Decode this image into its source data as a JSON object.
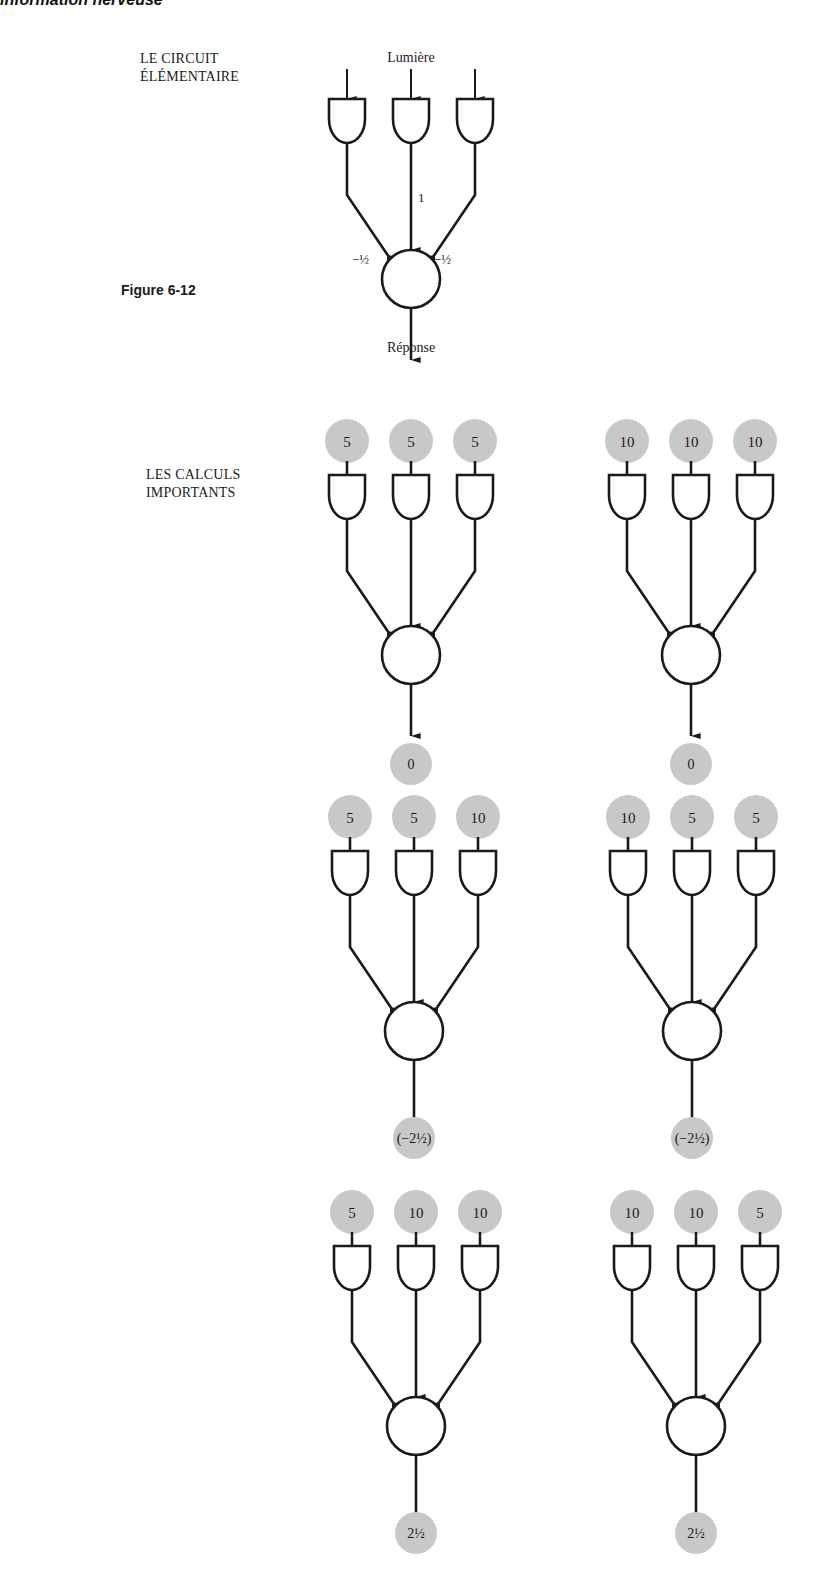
{
  "page": {
    "running_head": "information nerveuse",
    "figure_label": "Figure 6-12"
  },
  "sections": {
    "elementary": {
      "title_line1": "LE CIRCUIT",
      "title_line2": "ÉLÉMENTAIRE",
      "input_label": "Lumière",
      "output_label": "Réponse",
      "weights": {
        "left": "−½",
        "center": "1",
        "right": "−½"
      }
    },
    "calculations": {
      "title_line1": "LES CALCULS",
      "title_line2": "IMPORTANTS"
    }
  },
  "circuits": [
    {
      "id": "r1-left",
      "inputs": [
        "5",
        "5",
        "5"
      ],
      "output": "0",
      "output_arrow": true
    },
    {
      "id": "r1-right",
      "inputs": [
        "10",
        "10",
        "10"
      ],
      "output": "0",
      "output_arrow": true
    },
    {
      "id": "r2-left",
      "inputs": [
        "5",
        "5",
        "10"
      ],
      "output": "(−2½)",
      "output_arrow": false
    },
    {
      "id": "r2-right",
      "inputs": [
        "10",
        "5",
        "5"
      ],
      "output": "(−2½)",
      "output_arrow": false
    },
    {
      "id": "r3-left",
      "inputs": [
        "5",
        "10",
        "10"
      ],
      "output": "2½",
      "output_arrow": false
    },
    {
      "id": "r3-right",
      "inputs": [
        "10",
        "10",
        "5"
      ],
      "output": "2½",
      "output_arrow": false
    }
  ],
  "colors": {
    "ink": "#1a1a1a",
    "value_bubble": "#c8c8c8"
  }
}
